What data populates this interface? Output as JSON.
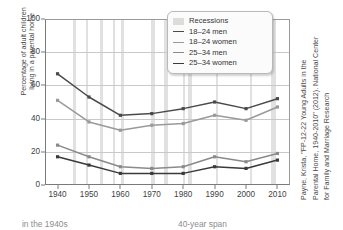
{
  "chart_data": {
    "type": "line",
    "title": "",
    "xlabel": "",
    "ylabel": "Percentage of adult children living in a parental home",
    "ylabel_lines": [
      "Percentage of adult children",
      "living in a parental home"
    ],
    "x": [
      1940,
      1950,
      1960,
      1970,
      1980,
      1990,
      2000,
      2010
    ],
    "xticklabels": [
      "1940",
      "1950",
      "1960",
      "1970",
      "1980",
      "1990",
      "2000",
      "2010"
    ],
    "yticklabels": [
      "0",
      "20",
      "40",
      "60",
      "80",
      "100"
    ],
    "yticks": [
      0,
      20,
      40,
      60,
      80,
      100
    ],
    "ylim": [
      0,
      100
    ],
    "xlim": [
      1936,
      2014
    ],
    "grid": "horizontal",
    "legend_position": "top-right",
    "series": [
      {
        "name": "18–24 men",
        "color": "#4a4a4a",
        "values": [
          67,
          53,
          42,
          43,
          46,
          50,
          46,
          52
        ]
      },
      {
        "name": "18–24 women",
        "color": "#9a9a9a",
        "values": [
          51,
          38,
          33,
          36,
          37,
          42,
          39,
          47
        ]
      },
      {
        "name": "25–34 men",
        "color": "#8a8a8a",
        "values": [
          24,
          17,
          11,
          10,
          11,
          17,
          14,
          19
        ]
      },
      {
        "name": "25–34 women",
        "color": "#3a3a3a",
        "values": [
          17,
          12,
          7,
          7,
          7,
          11,
          10,
          15
        ]
      }
    ],
    "shaded_label": "Recessions",
    "shaded_color": "#dcdcdc",
    "recessions": [
      [
        1945.0,
        1945.9
      ],
      [
        1948.9,
        1949.8
      ],
      [
        1953.5,
        1954.4
      ],
      [
        1957.6,
        1958.3
      ],
      [
        1960.3,
        1961.1
      ],
      [
        1969.9,
        1970.9
      ],
      [
        1973.9,
        1975.2
      ],
      [
        1980.0,
        1980.5
      ],
      [
        1981.5,
        1982.9
      ],
      [
        1990.5,
        1991.2
      ],
      [
        2001.2,
        2001.9
      ],
      [
        2007.9,
        2009.5
      ]
    ]
  },
  "legend": {
    "items": [
      {
        "label": "Recessions",
        "marker": "box",
        "color": "#dcdcdc"
      },
      {
        "label": "18–24 men",
        "marker": "line",
        "color": "#4a4a4a"
      },
      {
        "label": "18–24 women",
        "marker": "line",
        "color": "#9a9a9a"
      },
      {
        "label": "25–34 men",
        "marker": "line",
        "color": "#8a8a8a"
      },
      {
        "label": "25–34 women",
        "marker": "line",
        "color": "#3a3a3a"
      }
    ]
  },
  "credit": {
    "lines": [
      "Payne, Krista, \"FP-12-22 Young Adults in the",
      "Parental Home, 1940-2010\" (2012). National Center",
      "for Family and Marriage Research"
    ]
  },
  "caption_fragments": {
    "left": "in the 1940s",
    "right": "40-year span"
  }
}
